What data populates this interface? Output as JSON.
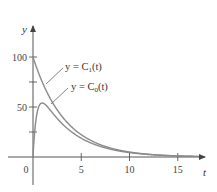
{
  "chart_data": {
    "type": "line",
    "title": "",
    "xlabel": "t",
    "ylabel": "y",
    "xlim": [
      -0.3,
      18
    ],
    "ylim": [
      -25,
      115
    ],
    "grid": false,
    "x_ticks": [
      0,
      5,
      10,
      15
    ],
    "x_tick_labels": [
      "0",
      "5",
      "10",
      "15"
    ],
    "y_ticks": [
      25,
      50,
      75,
      100
    ],
    "y_tick_labels": [
      "",
      "50",
      "",
      "100"
    ],
    "series": [
      {
        "name": "y = C1(t)",
        "label_text": "y = C",
        "label_sub": "1",
        "label_tail": "(t)",
        "x": [
          0,
          1,
          2,
          3,
          4,
          5,
          6,
          7,
          8,
          10,
          12,
          15,
          17
        ],
        "values": [
          100,
          74,
          55,
          41,
          30,
          22,
          16.5,
          12,
          9,
          5,
          2.7,
          1.1,
          0.6
        ]
      },
      {
        "name": "y = C0(t)",
        "label_text": "y = C",
        "label_sub": "0",
        "label_tail": "(t)",
        "x": [
          0,
          0.3,
          0.6,
          1,
          1.5,
          2,
          3,
          4,
          5,
          6,
          7,
          8,
          10,
          12,
          15,
          17
        ],
        "values": [
          0,
          42,
          56,
          59,
          55,
          49,
          38,
          28,
          21,
          15.5,
          11.5,
          8.5,
          4.7,
          2.6,
          1.1,
          0.6
        ]
      }
    ],
    "legend": "inline labels with leader lines"
  },
  "colors": {
    "axis": "#444444",
    "curve": "#7a7a7a",
    "text": "#333333"
  }
}
